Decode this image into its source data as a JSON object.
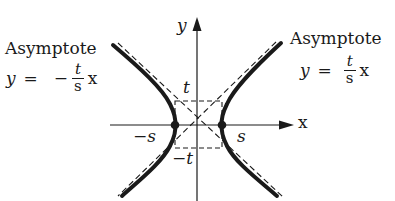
{
  "figure": {
    "colors": {
      "ink": "#1a1a1a",
      "background": "#ffffff"
    },
    "axes": {
      "x_label": "x",
      "y_label": "y"
    },
    "box_labels": {
      "top": "t",
      "bottom": "−t",
      "left": "−s",
      "right": "s"
    },
    "left_asymptote": {
      "title": "Asymptote",
      "lhs": "y",
      "equals": "=",
      "sign": "−",
      "numerator": "t",
      "denominator": "s",
      "variable": "x"
    },
    "right_asymptote": {
      "title": "Asymptote",
      "lhs": "y",
      "equals": "=",
      "sign": "",
      "numerator": "t",
      "denominator": "s",
      "variable": "x"
    }
  }
}
